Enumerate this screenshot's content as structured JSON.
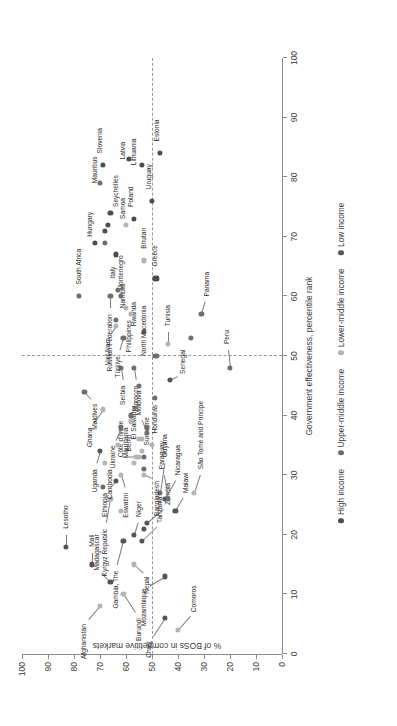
{
  "chart_data": {
    "type": "scatter",
    "title": "",
    "xlabel": "Government effectiveness, percentile rank",
    "ylabel": "% of BOSs in competitive markets",
    "xlim": [
      0,
      100
    ],
    "ylim": [
      0,
      100
    ],
    "xticks": [
      0,
      10,
      20,
      30,
      40,
      50,
      60,
      70,
      80,
      90,
      100
    ],
    "yticks": [
      0,
      10,
      20,
      30,
      40,
      50,
      60,
      70,
      80,
      90,
      100
    ],
    "grid": false,
    "reference_lines": {
      "x": 50,
      "y": 50,
      "style": "dashed"
    },
    "legend_position": "bottom-center",
    "series": [
      {
        "name": "High income",
        "color": "#4d4d4d"
      },
      {
        "name": "Upper-middle income",
        "color": "#6e6e6e"
      },
      {
        "name": "Lower-middle income",
        "color": "#b4b4b4"
      },
      {
        "name": "Low income",
        "color": "#555555"
      }
    ],
    "points": [
      {
        "label": "Comoros",
        "x": 4,
        "y": 40,
        "group": 2,
        "lx": 7,
        "ly": 34
      },
      {
        "label": "Chad",
        "x": 6,
        "y": 45,
        "group": 3,
        "lx": 2,
        "ly": 51
      },
      {
        "label": "Afghanistan",
        "x": 8,
        "y": 70,
        "group": 2,
        "lx": 5,
        "ly": 76
      },
      {
        "label": "Burundi",
        "x": 10,
        "y": 61,
        "group": 2,
        "lx": 6,
        "ly": 55
      },
      {
        "label": "Mozambique",
        "x": 13,
        "y": 45,
        "group": 3,
        "lx": 11,
        "ly": 53
      },
      {
        "label": "Madagascar",
        "x": 12,
        "y": 66,
        "group": 3,
        "lx": 14,
        "ly": 71
      },
      {
        "label": "Mali",
        "x": 15,
        "y": 73,
        "group": 3,
        "lx": 18,
        "ly": 73
      },
      {
        "label": "Nepal",
        "x": 15,
        "y": 57,
        "group": 2,
        "lx": 13,
        "ly": 52
      },
      {
        "label": "Lesotho",
        "x": 18,
        "y": 83,
        "group": 3,
        "lx": 21,
        "ly": 83
      },
      {
        "label": "Gambia, The",
        "x": 19,
        "y": 61,
        "group": 3,
        "lx": 14,
        "ly": 64
      },
      {
        "label": "Tanzania",
        "x": 19,
        "y": 54,
        "group": 3,
        "lx": 22,
        "ly": 47
      },
      {
        "label": "Niger",
        "x": 20,
        "y": 57,
        "group": 3,
        "lx": 23,
        "ly": 55
      },
      {
        "label": "Zambia",
        "x": 22,
        "y": 52,
        "group": 3,
        "lx": 25,
        "ly": 44
      },
      {
        "label": "Malawi",
        "x": 24,
        "y": 41,
        "group": 3,
        "lx": 27,
        "ly": 37
      },
      {
        "label": "Kyrgyz Republic",
        "x": 26,
        "y": 66,
        "group": 2,
        "lx": 21,
        "ly": 68
      },
      {
        "label": "Nicaragua",
        "x": 26,
        "y": 45,
        "group": 3,
        "lx": 30,
        "ly": 40
      },
      {
        "label": "Paraguay",
        "x": 26,
        "y": 44,
        "group": 1,
        "lx": 31,
        "ly": 46
      },
      {
        "label": "Guyana",
        "x": 27,
        "y": 47,
        "group": 1,
        "lx": 33,
        "ly": 45
      },
      {
        "label": "São Tomé and Príncipe",
        "x": 27,
        "y": 34,
        "group": 2,
        "lx": 31,
        "ly": 31
      },
      {
        "label": "Ethiopia",
        "x": 29,
        "y": 64,
        "group": 3,
        "lx": 27,
        "ly": 68
      },
      {
        "label": "Eswatini",
        "x": 30,
        "y": 62,
        "group": 2,
        "lx": 27,
        "ly": 60
      },
      {
        "label": "Bangladesh",
        "x": 30,
        "y": 53,
        "group": 2,
        "lx": 29,
        "ly": 48
      },
      {
        "label": "Cambodia",
        "x": 32,
        "y": 68,
        "group": 2,
        "lx": 31,
        "ly": 66
      },
      {
        "label": "Côte d'Ivoire",
        "x": 33,
        "y": 56,
        "group": 2,
        "lx": 33,
        "ly": 62
      },
      {
        "label": "Benin",
        "x": 33,
        "y": 55,
        "group": 2,
        "lx": 34,
        "ly": 59
      },
      {
        "label": "Suriname",
        "x": 33,
        "y": 53,
        "group": 1,
        "lx": 35,
        "ly": 52
      },
      {
        "label": "Uganda",
        "x": 34,
        "y": 70,
        "group": 3,
        "lx": 31,
        "ly": 72
      },
      {
        "label": "Honduras",
        "x": 35,
        "y": 50,
        "group": 2,
        "lx": 37,
        "ly": 49
      },
      {
        "label": "El Salvador",
        "x": 36,
        "y": 54,
        "group": 2,
        "lx": 36,
        "ly": 57
      },
      {
        "label": "Moldova",
        "x": 37,
        "y": 52,
        "group": 1,
        "lx": 40,
        "ly": 55
      },
      {
        "label": "Ukraine",
        "x": 38,
        "y": 62,
        "group": 1,
        "lx": 35,
        "ly": 65
      },
      {
        "label": "Mauritania",
        "x": 39,
        "y": 58,
        "group": 2,
        "lx": 38,
        "ly": 60
      },
      {
        "label": "Ghana",
        "x": 41,
        "y": 69,
        "group": 2,
        "lx": 38,
        "ly": 74
      },
      {
        "label": "Maldives",
        "x": 44,
        "y": 76,
        "group": 1,
        "lx": 42,
        "ly": 72
      },
      {
        "label": "Senegal",
        "x": 46,
        "y": 43,
        "group": 3,
        "lx": 47,
        "ly": 38
      },
      {
        "label": "Morocco",
        "x": 48,
        "y": 57,
        "group": 1,
        "lx": 45,
        "ly": 56
      },
      {
        "label": "Peru",
        "x": 48,
        "y": 20,
        "group": 1,
        "lx": 52,
        "ly": 21
      },
      {
        "label": "Serbia",
        "x": 48,
        "y": 62,
        "group": 1,
        "lx": 45,
        "ly": 61
      },
      {
        "label": "North Macedonia",
        "x": 50,
        "y": 49,
        "group": 1,
        "lx": 50,
        "ly": 53
      },
      {
        "label": "Tunisia",
        "x": 52,
        "y": 44,
        "group": 2,
        "lx": 55,
        "ly": 44
      },
      {
        "label": "Türkiye",
        "x": 53,
        "y": 61,
        "group": 1,
        "lx": 50,
        "ly": 63
      },
      {
        "label": "Rwanda",
        "x": 54,
        "y": 53,
        "group": 3,
        "lx": 55,
        "ly": 57
      },
      {
        "label": "Viet Nam",
        "x": 55,
        "y": 64,
        "group": 2,
        "lx": 53,
        "ly": 67
      },
      {
        "label": "Panama",
        "x": 57,
        "y": 31,
        "group": 1,
        "lx": 60,
        "ly": 29
      },
      {
        "label": "Namibia",
        "x": 57,
        "y": 58,
        "group": 2,
        "lx": 58,
        "ly": 61
      },
      {
        "label": "Philippines",
        "x": 58,
        "y": 60,
        "group": 2,
        "lx": 56,
        "ly": 59
      },
      {
        "label": "South Africa",
        "x": 60,
        "y": 78,
        "group": 1,
        "lx": 62,
        "ly": 78
      },
      {
        "label": "Montenegro",
        "x": 60,
        "y": 62,
        "group": 1,
        "lx": 61,
        "ly": 62
      },
      {
        "label": "Russian Federation",
        "x": 60,
        "y": 66,
        "group": 1,
        "lx": 57,
        "ly": 66
      },
      {
        "label": "Greece",
        "x": 63,
        "y": 48,
        "group": 0,
        "lx": 65,
        "ly": 49
      },
      {
        "label": "Bhutan",
        "x": 66,
        "y": 53,
        "group": 2,
        "lx": 68,
        "ly": 53
      },
      {
        "label": "Italy",
        "x": 67,
        "y": 64,
        "group": 0,
        "lx": 65,
        "ly": 65
      },
      {
        "label": "Hungary",
        "x": 69,
        "y": 72,
        "group": 0,
        "lx": 70,
        "ly": 74
      },
      {
        "label": "Samoa",
        "x": 72,
        "y": 60,
        "group": 2,
        "lx": 73,
        "ly": 61
      },
      {
        "label": "Poland",
        "x": 73,
        "y": 57,
        "group": 0,
        "lx": 75,
        "ly": 58
      },
      {
        "label": "Seychelles",
        "x": 74,
        "y": 66,
        "group": 0,
        "lx": 75,
        "ly": 64
      },
      {
        "label": "Uruguay",
        "x": 76,
        "y": 50,
        "group": 0,
        "lx": 78,
        "ly": 51
      },
      {
        "label": "Mauritius",
        "x": 79,
        "y": 70,
        "group": 1,
        "lx": 79,
        "ly": 72
      },
      {
        "label": "Estonia",
        "x": 84,
        "y": 47,
        "group": 0,
        "lx": 86,
        "ly": 48
      },
      {
        "label": "Lithuania",
        "x": 82,
        "y": 54,
        "group": 0,
        "lx": 82,
        "ly": 57
      },
      {
        "label": "Latvia",
        "x": 83,
        "y": 59,
        "group": 0,
        "lx": 83,
        "ly": 61
      },
      {
        "label": "Slovenia",
        "x": 82,
        "y": 69,
        "group": 0,
        "lx": 84,
        "ly": 70
      },
      {
        "label": "",
        "x": 45,
        "y": 55,
        "group": 1
      },
      {
        "label": "",
        "x": 43,
        "y": 49,
        "group": 1
      },
      {
        "label": "",
        "x": 50,
        "y": 48,
        "group": 1
      },
      {
        "label": "",
        "x": 53,
        "y": 35,
        "group": 1
      },
      {
        "label": "",
        "x": 38,
        "y": 52,
        "group": 1
      },
      {
        "label": "",
        "x": 35,
        "y": 63,
        "group": 2
      },
      {
        "label": "",
        "x": 32,
        "y": 57,
        "group": 2
      },
      {
        "label": "",
        "x": 28,
        "y": 69,
        "group": 1
      },
      {
        "label": "",
        "x": 24,
        "y": 62,
        "group": 2
      },
      {
        "label": "",
        "x": 21,
        "y": 53,
        "group": 3
      },
      {
        "label": "",
        "x": 61,
        "y": 63,
        "group": 1
      },
      {
        "label": "",
        "x": 69,
        "y": 68,
        "group": 1
      },
      {
        "label": "",
        "x": 71,
        "y": 68,
        "group": 0
      },
      {
        "label": "",
        "x": 72,
        "y": 67,
        "group": 0
      },
      {
        "label": "",
        "x": 63,
        "y": 49,
        "group": 0
      },
      {
        "label": "",
        "x": 56,
        "y": 64,
        "group": 1
      },
      {
        "label": "",
        "x": 40,
        "y": 58,
        "group": 1
      },
      {
        "label": "",
        "x": 36,
        "y": 55,
        "group": 2
      },
      {
        "label": "",
        "x": 34,
        "y": 54,
        "group": 2
      },
      {
        "label": "",
        "x": 31,
        "y": 53,
        "group": 1
      }
    ]
  },
  "axes": {
    "x_title": "Government effectiveness, percentile rank",
    "y_title": "% of BOSs in competitive markets",
    "x_tick_labels": [
      "0",
      "10",
      "20",
      "30",
      "40",
      "50",
      "60",
      "70",
      "80",
      "90",
      "100"
    ],
    "y_tick_labels": [
      "0",
      "10",
      "20",
      "30",
      "40",
      "50",
      "60",
      "70",
      "80",
      "90",
      "100"
    ]
  },
  "legend": {
    "items": [
      {
        "label": "High income",
        "color": "#4d4d4d"
      },
      {
        "label": "Upper-middle income",
        "color": "#6e6e6e"
      },
      {
        "label": "Lower-middle income",
        "color": "#b4b4b4"
      },
      {
        "label": "Low income",
        "color": "#555555"
      }
    ]
  }
}
